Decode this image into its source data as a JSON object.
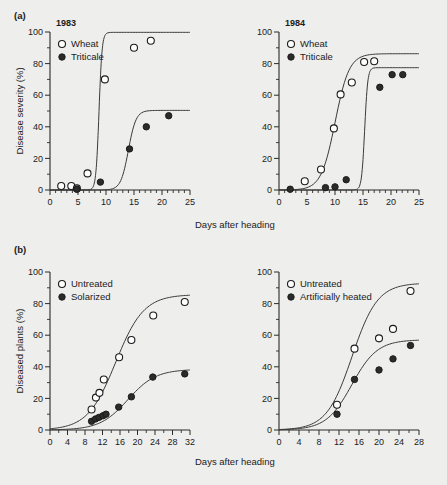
{
  "figure": {
    "background_color": "#eeeeec",
    "ink_color": "#1b1b1b",
    "panels": [
      {
        "tag": "(a)",
        "ylabel": "Disease severity (%)",
        "xlabel": "Days after heading"
      },
      {
        "tag": "(b)",
        "ylabel": "Diseased plants (%)",
        "xlabel": "Days after heading"
      }
    ]
  },
  "chart_data": [
    {
      "id": "panel-a-1983",
      "type": "scatter",
      "title": "1983",
      "panel_tag": "(a)",
      "xlabel": "Days after heading",
      "ylabel": "Disease severity (%)",
      "xlim": [
        0,
        25
      ],
      "ylim": [
        0,
        100
      ],
      "xticks": [
        0,
        5,
        10,
        15,
        20,
        25
      ],
      "yticks": [
        0,
        20,
        40,
        60,
        80,
        100
      ],
      "x_minor_step": 1,
      "y_minor_step": 10,
      "grid": false,
      "legend_position": "top-left",
      "series": [
        {
          "name": "Wheat",
          "marker": "open-circle",
          "x": [
            2.0,
            3.8,
            4.8,
            6.7,
            9.8,
            15.0,
            18.0
          ],
          "y": [
            2.5,
            2.5,
            1.0,
            10.5,
            70.0,
            90.0,
            94.5
          ]
        },
        {
          "name": "Triticale",
          "marker": "filled-circle",
          "x": [
            4.8,
            9.0,
            14.2,
            17.2,
            21.2
          ],
          "y": [
            0.5,
            5.0,
            26.0,
            40.0,
            47.0
          ]
        }
      ]
    },
    {
      "id": "panel-a-1984",
      "type": "scatter",
      "title": "1984",
      "panel_tag": "(a)",
      "xlabel": "Days after heading",
      "ylabel": "Disease severity (%)",
      "xlim": [
        0,
        25
      ],
      "ylim": [
        0,
        100
      ],
      "xticks": [
        0,
        5,
        10,
        15,
        20,
        25
      ],
      "yticks": [
        0,
        20,
        40,
        60,
        80,
        100
      ],
      "x_minor_step": 1,
      "y_minor_step": 10,
      "grid": false,
      "legend_position": "top-left",
      "series": [
        {
          "name": "Wheat",
          "marker": "open-circle",
          "x": [
            4.6,
            7.5,
            9.8,
            11.0,
            13.0,
            15.2,
            17.0
          ],
          "y": [
            5.5,
            13.0,
            39.0,
            60.5,
            68.0,
            81.0,
            81.5
          ]
        },
        {
          "name": "Triticale",
          "marker": "filled-circle",
          "x": [
            2.0,
            8.3,
            10.0,
            12.0,
            18.0,
            20.2,
            22.1
          ],
          "y": [
            0.5,
            1.5,
            2.0,
            6.5,
            65.0,
            73.0,
            73.0
          ]
        }
      ]
    },
    {
      "id": "panel-b-solarized",
      "type": "scatter",
      "title": "",
      "panel_tag": "(b)",
      "xlabel": "Days after heading",
      "ylabel": "Diseased plants (%)",
      "xlim": [
        0,
        32
      ],
      "ylim": [
        0,
        100
      ],
      "xticks": [
        0,
        4,
        8,
        12,
        16,
        20,
        24,
        28,
        32
      ],
      "yticks": [
        0,
        20,
        40,
        60,
        80,
        100
      ],
      "x_minor_step": 2,
      "y_minor_step": 10,
      "grid": false,
      "legend_position": "top-left",
      "series": [
        {
          "name": "Untreated",
          "marker": "open-circle",
          "x": [
            9.5,
            10.5,
            11.3,
            12.3,
            15.8,
            18.6,
            23.6,
            30.8
          ],
          "y": [
            13.0,
            20.5,
            23.5,
            32.0,
            46.0,
            57.0,
            72.5,
            81.0
          ]
        },
        {
          "name": "Solarized",
          "marker": "filled-circle",
          "x": [
            9.5,
            10.4,
            11.2,
            12.1,
            12.8,
            15.7,
            18.6,
            23.5,
            30.8
          ],
          "y": [
            5.5,
            7.0,
            8.0,
            9.0,
            10.0,
            14.5,
            21.0,
            33.5,
            35.5
          ]
        }
      ]
    },
    {
      "id": "panel-b-artificially-heated",
      "type": "scatter",
      "title": "",
      "panel_tag": "(b)",
      "xlabel": "Days after heading",
      "ylabel": "Diseased plants (%)",
      "xlim": [
        0,
        28
      ],
      "ylim": [
        0,
        100
      ],
      "xticks": [
        0,
        4,
        8,
        12,
        16,
        20,
        24,
        28
      ],
      "yticks": [
        0,
        20,
        40,
        60,
        80,
        100
      ],
      "x_minor_step": 2,
      "y_minor_step": 10,
      "grid": false,
      "legend_position": "top-left",
      "series": [
        {
          "name": "Untreated",
          "marker": "open-circle",
          "x": [
            11.6,
            15.1,
            20.0,
            22.8,
            26.3
          ],
          "y": [
            16.0,
            51.5,
            58.0,
            64.0,
            88.0
          ]
        },
        {
          "name": "Artificially heated",
          "marker": "filled-circle",
          "x": [
            11.6,
            15.1,
            20.0,
            22.8,
            26.3
          ],
          "y": [
            10.0,
            32.0,
            38.0,
            45.0,
            53.5
          ]
        }
      ]
    }
  ]
}
